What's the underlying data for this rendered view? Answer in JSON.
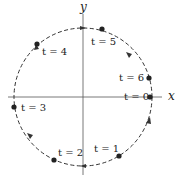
{
  "diagram": {
    "type": "parametric-circle",
    "axes": {
      "x_label": "x",
      "y_label": "y"
    },
    "circle": {
      "style": "dashed",
      "direction": "clockwise",
      "color": "#333333"
    },
    "points": [
      {
        "t": 0,
        "label": "t = 0"
      },
      {
        "t": 1,
        "label": "t = 1"
      },
      {
        "t": 2,
        "label": "t = 2"
      },
      {
        "t": 3,
        "label": "t = 3"
      },
      {
        "t": 4,
        "label": "t = 4"
      },
      {
        "t": 5,
        "label": "t = 5"
      },
      {
        "t": 6,
        "label": "t = 6"
      }
    ]
  }
}
